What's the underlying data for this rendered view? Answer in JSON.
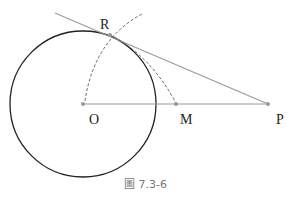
{
  "figure": {
    "caption": "圖 7.3-6",
    "points": {
      "O": {
        "label": "O",
        "x": 83,
        "y": 104
      },
      "R": {
        "label": "R",
        "x": 110,
        "y": 35
      },
      "M": {
        "label": "M",
        "x": 176,
        "y": 104
      },
      "P": {
        "label": "P",
        "x": 268,
        "y": 104
      }
    },
    "circle": {
      "cx": 83,
      "cy": 104,
      "r": 73,
      "stroke": "#222222"
    },
    "colors": {
      "line": "#9a9a9a",
      "dashed": "#555555",
      "point": "#999999"
    }
  }
}
